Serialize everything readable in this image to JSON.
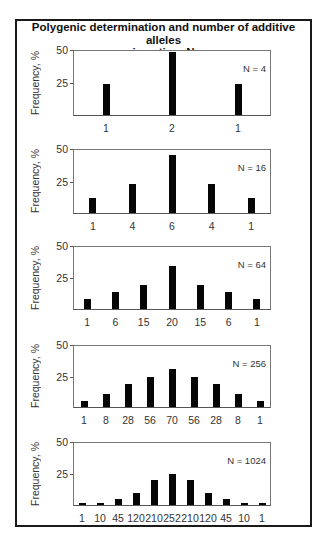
{
  "title_line1": "Polygenic determination and number of additive alleles",
  "title_line2": "in action, N",
  "chart_data": [
    {
      "type": "bar",
      "label": "N = 4",
      "categories": [
        "1",
        "2",
        "1"
      ],
      "values": [
        24,
        49,
        24
      ],
      "ylabel": "Frequency, %",
      "yticks": [
        25,
        50
      ],
      "ylim": [
        0,
        50
      ],
      "grid": false
    },
    {
      "type": "bar",
      "label": "N = 16",
      "categories": [
        "1",
        "4",
        "6",
        "4",
        "1"
      ],
      "values": [
        12,
        23,
        46,
        23,
        12
      ],
      "ylabel": "Frequency, %",
      "yticks": [
        25,
        50
      ],
      "ylim": [
        0,
        50
      ],
      "grid": false
    },
    {
      "type": "bar",
      "label": "N = 64",
      "categories": [
        "1",
        "6",
        "15",
        "20",
        "15",
        "6",
        "1"
      ],
      "values": [
        8,
        14,
        19,
        35,
        19,
        14,
        8
      ],
      "ylabel": "Frequency, %",
      "yticks": [
        25,
        50
      ],
      "ylim": [
        0,
        50
      ],
      "grid": false
    },
    {
      "type": "bar",
      "label": "N = 256",
      "categories": [
        "1",
        "8",
        "28",
        "56",
        "70",
        "56",
        "28",
        "8",
        "1"
      ],
      "values": [
        5,
        11,
        19,
        25,
        31,
        25,
        19,
        11,
        5
      ],
      "ylabel": "Frequency, %",
      "yticks": [
        25,
        50
      ],
      "ylim": [
        0,
        50
      ],
      "grid": false
    },
    {
      "type": "bar",
      "label": "N = 1024",
      "categories": [
        "1",
        "10",
        "45",
        "120",
        "210",
        "252",
        "210",
        "120",
        "45",
        "10",
        "1"
      ],
      "values": [
        2,
        2,
        5,
        10,
        20,
        25,
        20,
        10,
        5,
        2,
        2
      ],
      "ylabel": "Frequency, %",
      "yticks": [
        25,
        50
      ],
      "ylim": [
        0,
        50
      ],
      "grid": false
    }
  ],
  "colors": {
    "bar": "#050505",
    "frame": "#1a1a1a",
    "axis": "#555555"
  }
}
